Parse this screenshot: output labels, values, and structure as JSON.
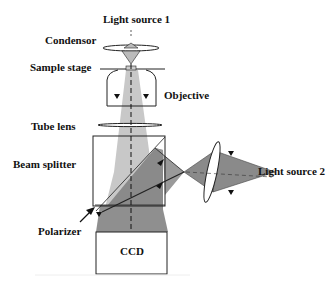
{
  "diagram": {
    "labels": {
      "light_source_1": "Light source 1",
      "condensor": "Condensor",
      "sample_stage": "Sample stage",
      "objective": "Objective",
      "tube_lens": "Tube lens",
      "beam_splitter": "Beam splitter",
      "light_source_2": "Light source 2",
      "polarizer": "Polarizer",
      "ccd": "CCD"
    },
    "colors": {
      "beam_light": "#c8c8c8",
      "beam_mid": "#9a9a9a",
      "beam_dark": "#7a7a7a",
      "outline": "#222222"
    }
  }
}
